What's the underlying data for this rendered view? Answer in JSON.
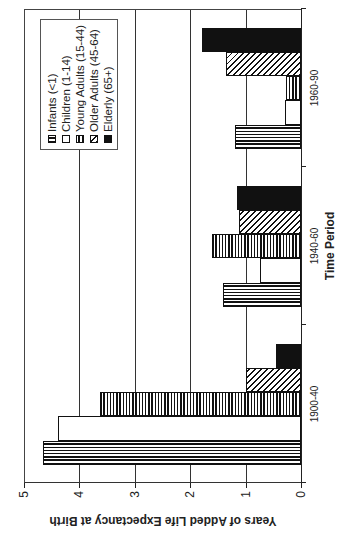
{
  "chart_data": {
    "type": "bar",
    "orientation_note": "figure rotated 90 degrees counterclockwise",
    "title": "",
    "xlabel": "Time Period",
    "ylabel": "Years of Added Life Expectancy at Birth",
    "ylim": [
      0,
      5
    ],
    "yticks": [
      "0",
      "1",
      "2",
      "3",
      "4",
      "5"
    ],
    "grid": true,
    "legend_position": "upper right (inside plot)",
    "categories": [
      "1900-40",
      "1940-60",
      "1960-90"
    ],
    "series": [
      {
        "name": "Infants (<1)",
        "pattern": "vlines",
        "values": [
          4.66,
          1.41,
          1.2
        ]
      },
      {
        "name": "Children (1-14)",
        "pattern": "white",
        "values": [
          4.39,
          0.74,
          0.28
        ]
      },
      {
        "name": "Young Adults (15-44)",
        "pattern": "hlines",
        "values": [
          3.63,
          1.6,
          0.27
        ]
      },
      {
        "name": "Older Adults (45-64)",
        "pattern": "hatch",
        "values": [
          1.0,
          1.12,
          1.35
        ]
      },
      {
        "name": "Elderly (65+)",
        "pattern": "solid",
        "values": [
          0.45,
          1.16,
          1.78
        ]
      }
    ]
  },
  "axis": {
    "y_title": "Years of Added Life Expectancy at Birth",
    "x_title": "Time Period"
  },
  "legend": {
    "items": [
      "Infants (<1)",
      "Children (1-14)",
      "Young Adults (15-44)",
      "Older Adults (45-64)",
      "Elderly (65+)"
    ]
  }
}
